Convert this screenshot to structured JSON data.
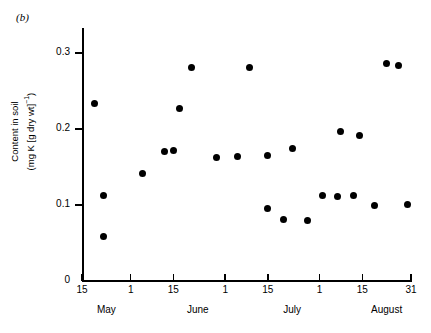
{
  "panel_label": "(b)",
  "chart_data": {
    "type": "scatter",
    "title": "",
    "xlabel": "",
    "ylabel": "Content in soil (mg K [g dry wt]⁻¹)",
    "ylabel_line1": "Content in soil",
    "ylabel_line2_prefix": "(mg K [g dry wt]",
    "ylabel_line2_sup": "−1",
    "ylabel_line2_suffix": ")",
    "ylim": [
      0,
      0.325
    ],
    "ytick_values": [
      0,
      0.1,
      0.2,
      0.3
    ],
    "ytick_labels": [
      "0",
      "0.1",
      "0.2",
      "0.3"
    ],
    "xlim": [
      0,
      108
    ],
    "xtick_daynumbers": [
      0,
      16,
      30,
      47,
      61,
      78,
      92,
      108
    ],
    "xtick_labels": [
      "15",
      "1",
      "15",
      "1",
      "15",
      "1",
      "15",
      "31"
    ],
    "month_labels": [
      "May",
      "June",
      "July",
      "August"
    ],
    "month_daynumbers": [
      8,
      38,
      69,
      100
    ],
    "grid": false,
    "legend": false,
    "marker": "filled-circle",
    "marker_color": "#000000",
    "points": [
      {
        "day": 4,
        "value": 0.233
      },
      {
        "day": 7,
        "value": 0.112
      },
      {
        "day": 7,
        "value": 0.058
      },
      {
        "day": 20,
        "value": 0.141
      },
      {
        "day": 27,
        "value": 0.17
      },
      {
        "day": 30,
        "value": 0.172
      },
      {
        "day": 32,
        "value": 0.227
      },
      {
        "day": 36,
        "value": 0.281
      },
      {
        "day": 44,
        "value": 0.163
      },
      {
        "day": 51,
        "value": 0.164
      },
      {
        "day": 55,
        "value": 0.281
      },
      {
        "day": 61,
        "value": 0.165
      },
      {
        "day": 61,
        "value": 0.095
      },
      {
        "day": 66,
        "value": 0.081
      },
      {
        "day": 69,
        "value": 0.174
      },
      {
        "day": 74,
        "value": 0.079
      },
      {
        "day": 79,
        "value": 0.113
      },
      {
        "day": 84,
        "value": 0.111
      },
      {
        "day": 85,
        "value": 0.197
      },
      {
        "day": 89,
        "value": 0.112
      },
      {
        "day": 91,
        "value": 0.192
      },
      {
        "day": 96,
        "value": 0.099
      },
      {
        "day": 100,
        "value": 0.286
      },
      {
        "day": 104,
        "value": 0.284
      },
      {
        "day": 107,
        "value": 0.101
      }
    ]
  }
}
